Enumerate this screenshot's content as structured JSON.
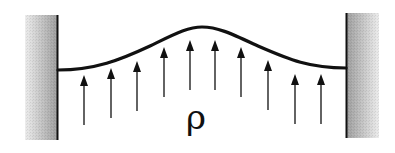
{
  "diagram": {
    "label": "ρ",
    "colors": {
      "ink": "#111111",
      "wall_dark": "#9a9a9a",
      "wall_light": "#e6e6e6"
    },
    "walls": [
      {
        "side": "left",
        "x": 25,
        "y": 15,
        "width": 33,
        "height": 125,
        "edge_x": 57
      },
      {
        "side": "right",
        "x": 346,
        "y": 13,
        "width": 33,
        "height": 125,
        "edge_x": 346
      }
    ],
    "membrane": {
      "start": [
        58,
        70
      ],
      "peak": [
        200,
        27
      ],
      "end": [
        346,
        68
      ]
    },
    "arrows": [
      {
        "x": 84,
        "tip": 75,
        "base": 125
      },
      {
        "x": 111,
        "tip": 68,
        "base": 118
      },
      {
        "x": 137,
        "tip": 61,
        "base": 111
      },
      {
        "x": 164,
        "tip": 47,
        "base": 97
      },
      {
        "x": 190,
        "tip": 40,
        "base": 90
      },
      {
        "x": 215,
        "tip": 40,
        "base": 90
      },
      {
        "x": 241,
        "tip": 47,
        "base": 97
      },
      {
        "x": 268,
        "tip": 60,
        "base": 110
      },
      {
        "x": 295,
        "tip": 74,
        "base": 124
      },
      {
        "x": 321,
        "tip": 74,
        "base": 124
      }
    ]
  }
}
